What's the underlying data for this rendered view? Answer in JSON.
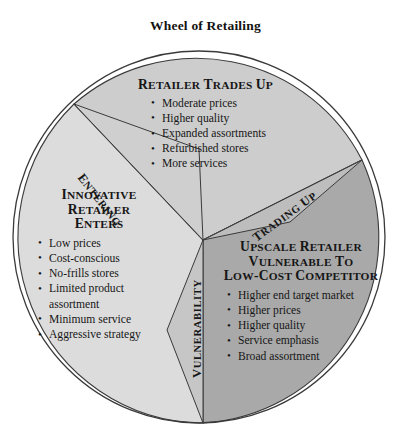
{
  "title": "Wheel of Retailing",
  "colors": {
    "sector_top": "#cdcdcd",
    "sector_left": "#dcdcdc",
    "sector_right": "#a9a9a9",
    "outline": "#3a3a3a",
    "text": "#161616",
    "background": "#ffffff"
  },
  "chart_data": {
    "type": "pie",
    "title": "Wheel of Retailing",
    "sectors": [
      {
        "id": "retailer-trades-up",
        "heading": "Retailer Trades Up",
        "heading_lines": [
          "Retailer Trades Up"
        ],
        "fill": "#cdcdcd",
        "bullets": [
          "Moderate prices",
          "Higher quality",
          "Expanded assortments",
          "Refurbished stores",
          "More services"
        ]
      },
      {
        "id": "innovative-retailer-enters",
        "heading": "Innovative Retailer Enters",
        "heading_lines": [
          "Innovative",
          "Retailer",
          "Enters"
        ],
        "fill": "#dcdcdc",
        "bullets": [
          "Low prices",
          "Cost-conscious",
          "No-frills stores",
          "Limited product assortment",
          "Minimum service",
          "Aggressive strategy"
        ]
      },
      {
        "id": "upscale-retailer-vulnerable",
        "heading": "Upscale Retailer Vulnerable to Low-cost Competitor",
        "heading_lines": [
          "Upscale Retailer",
          "Vulnerable to",
          "Low-cost Competitor"
        ],
        "fill": "#a9a9a9",
        "bullets": [
          "Higher end target market",
          "Higher prices",
          "Higher quality",
          "Service emphasis",
          "Broad assortment"
        ]
      }
    ],
    "connectors": [
      {
        "id": "entering",
        "label": "Entering",
        "rotation_deg": 52
      },
      {
        "id": "trading-up",
        "label": "Trading Up",
        "rotation_deg": -36
      },
      {
        "id": "vulnerability",
        "label": "Vulnerability",
        "rotation_deg": -90
      }
    ]
  },
  "top": {
    "heading": "Retailer Trades Up",
    "bullets": [
      "Moderate prices",
      "Higher quality",
      "Expanded assortments",
      "Refurbished stores",
      "More services"
    ]
  },
  "left": {
    "heading_line1": "Innovative",
    "heading_line2": "Retailer",
    "heading_line3": "Enters",
    "bullets": [
      "Low prices",
      "Cost-conscious",
      "No-frills stores",
      "Limited product",
      "assortment",
      "Minimum service",
      "Aggressive strategy"
    ]
  },
  "right": {
    "heading_line1": "Upscale Retailer",
    "heading_line2": "Vulnerable to",
    "heading_line3": "Low-cost Competitor",
    "bullets": [
      "Higher end target market",
      "Higher prices",
      "Higher quality",
      "Service emphasis",
      "Broad assortment"
    ]
  },
  "connectors": {
    "entering": "Entering",
    "trading_up": "Trading Up",
    "vulnerability": "Vulnerability"
  }
}
